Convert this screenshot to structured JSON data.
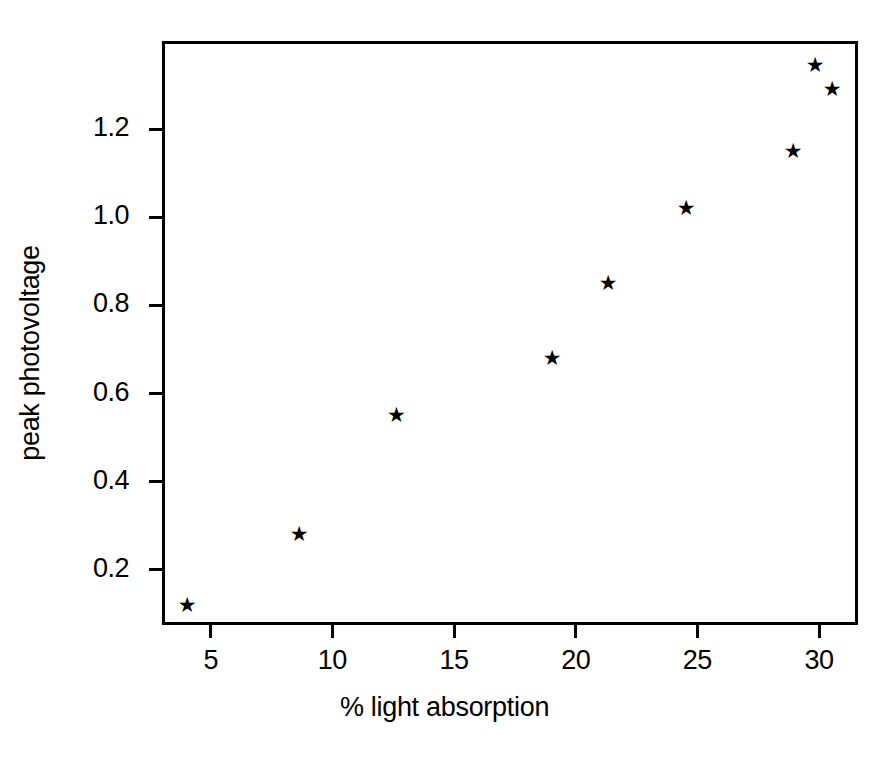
{
  "chart_data": {
    "type": "scatter",
    "title": "",
    "xlabel": "% light absorption",
    "ylabel": "peak photovoltage",
    "xlim": [
      3.0,
      31.6
    ],
    "ylim": [
      0.075,
      1.4
    ],
    "xticks": [
      5,
      10,
      15,
      20,
      25,
      30
    ],
    "xticklabels": [
      "5",
      "10",
      "15",
      "20",
      "25",
      "30"
    ],
    "yticks": [
      0.2,
      0.4,
      0.6,
      0.8,
      1.0,
      1.2
    ],
    "yticklabels": [
      "0.2",
      "0.4",
      "0.6",
      "0.8",
      "1.0",
      "1.2"
    ],
    "grid": false,
    "legend": null,
    "marker": "star",
    "marker_color": "#000000",
    "x": [
      4.0,
      8.6,
      12.6,
      19.0,
      21.3,
      24.5,
      28.9,
      29.8,
      30.5
    ],
    "y": [
      0.12,
      0.28,
      0.55,
      0.68,
      0.85,
      1.02,
      1.15,
      1.345,
      1.29
    ],
    "points": [
      {
        "x": 4.0,
        "y": 0.12
      },
      {
        "x": 8.6,
        "y": 0.28
      },
      {
        "x": 12.6,
        "y": 0.55
      },
      {
        "x": 19.0,
        "y": 0.68
      },
      {
        "x": 21.3,
        "y": 0.85
      },
      {
        "x": 24.5,
        "y": 1.02
      },
      {
        "x": 28.9,
        "y": 1.15
      },
      {
        "x": 29.8,
        "y": 1.345
      },
      {
        "x": 30.5,
        "y": 1.29
      }
    ]
  },
  "marker_glyph": "★"
}
